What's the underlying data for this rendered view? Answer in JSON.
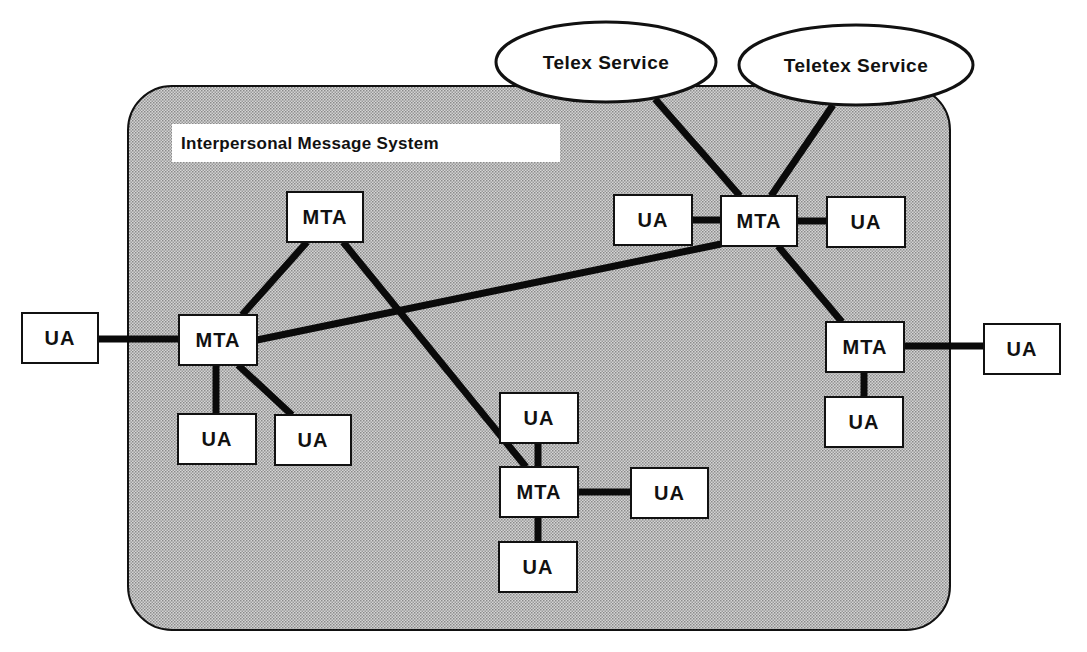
{
  "system": {
    "label": "Interpersonal Message System",
    "box": {
      "x": 128,
      "y": 86,
      "w": 822,
      "h": 544,
      "r": 44
    },
    "label_box": {
      "x": 172,
      "y": 124,
      "w": 388,
      "h": 38
    },
    "fill": "#bdbdbd",
    "stroke": "#111111"
  },
  "services": [
    {
      "id": "telex",
      "label": "Telex Service",
      "cx": 606,
      "cy": 62,
      "rx": 110,
      "ry": 40
    },
    {
      "id": "teletex",
      "label": "Teletex Service",
      "cx": 856,
      "cy": 65,
      "rx": 117,
      "ry": 40
    }
  ],
  "nodes": [
    {
      "id": "mta_top",
      "type": "MTA",
      "label": "MTA",
      "x": 287,
      "y": 192,
      "w": 76,
      "h": 50
    },
    {
      "id": "mta_left",
      "type": "MTA",
      "label": "MTA",
      "x": 179,
      "y": 315,
      "w": 78,
      "h": 50
    },
    {
      "id": "ua_far_left",
      "type": "UA",
      "label": "UA",
      "x": 22,
      "y": 313,
      "w": 76,
      "h": 50
    },
    {
      "id": "ua_left_1",
      "type": "UA",
      "label": "UA",
      "x": 178,
      "y": 414,
      "w": 78,
      "h": 50
    },
    {
      "id": "ua_left_2",
      "type": "UA",
      "label": "UA",
      "x": 275,
      "y": 415,
      "w": 76,
      "h": 50
    },
    {
      "id": "mta_upper_right",
      "type": "MTA",
      "label": "MTA",
      "x": 721,
      "y": 196,
      "w": 76,
      "h": 50
    },
    {
      "id": "ua_ur_left",
      "type": "UA",
      "label": "UA",
      "x": 614,
      "y": 195,
      "w": 78,
      "h": 50
    },
    {
      "id": "ua_ur_right",
      "type": "UA",
      "label": "UA",
      "x": 827,
      "y": 197,
      "w": 78,
      "h": 50
    },
    {
      "id": "mta_right",
      "type": "MTA",
      "label": "MTA",
      "x": 826,
      "y": 322,
      "w": 78,
      "h": 50
    },
    {
      "id": "ua_far_right",
      "type": "UA",
      "label": "UA",
      "x": 984,
      "y": 324,
      "w": 76,
      "h": 50
    },
    {
      "id": "ua_right_below",
      "type": "UA",
      "label": "UA",
      "x": 825,
      "y": 397,
      "w": 78,
      "h": 50
    },
    {
      "id": "mta_bottom",
      "type": "MTA",
      "label": "MTA",
      "x": 500,
      "y": 467,
      "w": 78,
      "h": 50
    },
    {
      "id": "ua_bottom_top",
      "type": "UA",
      "label": "UA",
      "x": 500,
      "y": 393,
      "w": 78,
      "h": 50
    },
    {
      "id": "ua_bottom_right",
      "type": "UA",
      "label": "UA",
      "x": 631,
      "y": 468,
      "w": 77,
      "h": 50
    },
    {
      "id": "ua_bottom_below",
      "type": "UA",
      "label": "UA",
      "x": 499,
      "y": 542,
      "w": 78,
      "h": 50
    }
  ],
  "links": [
    {
      "x1": 98,
      "y1": 339,
      "x2": 179,
      "y2": 339
    },
    {
      "x1": 307,
      "y1": 242,
      "x2": 242,
      "y2": 315
    },
    {
      "x1": 343,
      "y1": 242,
      "x2": 526,
      "y2": 467
    },
    {
      "x1": 257,
      "y1": 340,
      "x2": 721,
      "y2": 244
    },
    {
      "x1": 216,
      "y1": 365,
      "x2": 216,
      "y2": 414
    },
    {
      "x1": 238,
      "y1": 365,
      "x2": 292,
      "y2": 415
    },
    {
      "x1": 692,
      "y1": 220,
      "x2": 721,
      "y2": 220
    },
    {
      "x1": 797,
      "y1": 221,
      "x2": 827,
      "y2": 221
    },
    {
      "x1": 655,
      "y1": 99,
      "x2": 740,
      "y2": 196
    },
    {
      "x1": 833,
      "y1": 105,
      "x2": 771,
      "y2": 196
    },
    {
      "x1": 778,
      "y1": 246,
      "x2": 842,
      "y2": 322
    },
    {
      "x1": 904,
      "y1": 346,
      "x2": 984,
      "y2": 346
    },
    {
      "x1": 864,
      "y1": 372,
      "x2": 864,
      "y2": 397
    },
    {
      "x1": 538,
      "y1": 443,
      "x2": 538,
      "y2": 467
    },
    {
      "x1": 578,
      "y1": 492,
      "x2": 631,
      "y2": 492
    },
    {
      "x1": 538,
      "y1": 517,
      "x2": 538,
      "y2": 542
    }
  ],
  "style": {
    "link_color": "#0a0a0a",
    "link_width": 7,
    "node_fill": "#ffffff",
    "node_stroke": "#111111"
  }
}
